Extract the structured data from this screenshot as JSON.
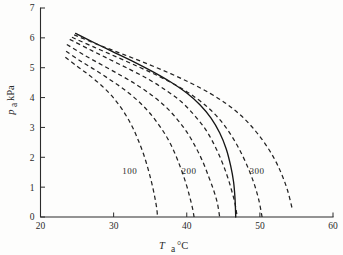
{
  "chart_data": {
    "type": "line",
    "title": "",
    "xlabel": "T, °C",
    "ylabel": "p, kPa",
    "xlabel_symbol": "T",
    "xlabel_subscript": "a",
    "xlabel_unit": "°C",
    "ylabel_symbol": "p",
    "ylabel_subscript": "a",
    "ylabel_unit": "kPa",
    "xlim": [
      20,
      60
    ],
    "ylim": [
      0,
      7
    ],
    "xticks": [
      20,
      30,
      40,
      50,
      60
    ],
    "xtick_labels": [
      "20",
      "30",
      "40",
      "50",
      "60"
    ],
    "yticks": [
      0,
      1,
      2,
      3,
      4,
      5,
      6,
      7
    ],
    "ytick_labels": [
      "0",
      "1",
      "2",
      "3",
      "4",
      "5",
      "6",
      "7"
    ],
    "grid": false,
    "legend": "none",
    "annotations": [
      {
        "text": "100",
        "x": 32.2,
        "y": 1.45
      },
      {
        "text": "200",
        "x": 40.3,
        "y": 1.45
      },
      {
        "text": "300",
        "x": 49.6,
        "y": 1.45
      }
    ],
    "series": [
      {
        "name": "curve-1",
        "style": "dashed",
        "label": "100",
        "points": [
          [
            23.4,
            5.35
          ],
          [
            25.0,
            5.05
          ],
          [
            26.5,
            4.78
          ],
          [
            28.0,
            4.48
          ],
          [
            29.4,
            4.15
          ],
          [
            30.6,
            3.8
          ],
          [
            31.7,
            3.4
          ],
          [
            32.6,
            3.0
          ],
          [
            33.4,
            2.55
          ],
          [
            34.1,
            2.1
          ],
          [
            34.7,
            1.62
          ],
          [
            35.2,
            1.15
          ],
          [
            35.6,
            0.7
          ],
          [
            35.9,
            0.28
          ],
          [
            36.0,
            0.0
          ]
        ]
      },
      {
        "name": "curve-2",
        "style": "dashed",
        "points": [
          [
            23.5,
            5.55
          ],
          [
            25.5,
            5.22
          ],
          [
            27.5,
            4.92
          ],
          [
            29.5,
            4.6
          ],
          [
            31.4,
            4.28
          ],
          [
            33.2,
            3.92
          ],
          [
            34.8,
            3.52
          ],
          [
            36.2,
            3.08
          ],
          [
            37.4,
            2.62
          ],
          [
            38.4,
            2.12
          ],
          [
            39.2,
            1.62
          ],
          [
            39.9,
            1.12
          ],
          [
            40.4,
            0.68
          ],
          [
            40.8,
            0.28
          ],
          [
            41.0,
            0.0
          ]
        ]
      },
      {
        "name": "curve-3",
        "style": "dashed",
        "points": [
          [
            23.6,
            5.78
          ],
          [
            26.0,
            5.42
          ],
          [
            28.5,
            5.08
          ],
          [
            31.0,
            4.74
          ],
          [
            33.2,
            4.42
          ],
          [
            35.2,
            4.08
          ],
          [
            37.0,
            3.72
          ],
          [
            38.6,
            3.3
          ],
          [
            40.0,
            2.85
          ],
          [
            41.2,
            2.35
          ],
          [
            42.2,
            1.85
          ],
          [
            43.0,
            1.35
          ],
          [
            43.7,
            0.88
          ],
          [
            44.2,
            0.45
          ],
          [
            44.5,
            0.0
          ]
        ]
      },
      {
        "name": "curve-4",
        "style": "dashed",
        "label": "200",
        "points": [
          [
            24.0,
            5.95
          ],
          [
            26.8,
            5.6
          ],
          [
            29.6,
            5.26
          ],
          [
            32.4,
            4.92
          ],
          [
            35.0,
            4.58
          ],
          [
            37.3,
            4.22
          ],
          [
            39.3,
            3.85
          ],
          [
            41.0,
            3.42
          ],
          [
            42.5,
            2.96
          ],
          [
            43.7,
            2.45
          ],
          [
            44.7,
            1.92
          ],
          [
            45.5,
            1.4
          ],
          [
            46.1,
            0.92
          ],
          [
            46.6,
            0.45
          ],
          [
            46.9,
            0.0
          ]
        ]
      },
      {
        "name": "curve-solid",
        "style": "solid",
        "points": [
          [
            24.8,
            6.15
          ],
          [
            27.5,
            5.82
          ],
          [
            30.2,
            5.5
          ],
          [
            32.9,
            5.18
          ],
          [
            35.4,
            4.86
          ],
          [
            37.8,
            4.52
          ],
          [
            40.0,
            4.15
          ],
          [
            41.8,
            3.76
          ],
          [
            43.3,
            3.32
          ],
          [
            44.5,
            2.82
          ],
          [
            45.4,
            2.28
          ],
          [
            46.0,
            1.72
          ],
          [
            46.4,
            1.18
          ],
          [
            46.6,
            0.62
          ],
          [
            46.7,
            0.0
          ]
        ]
      },
      {
        "name": "curve-5",
        "style": "dashed",
        "points": [
          [
            24.3,
            6.02
          ],
          [
            27.4,
            5.68
          ],
          [
            30.5,
            5.35
          ],
          [
            33.5,
            5.02
          ],
          [
            36.3,
            4.7
          ],
          [
            38.9,
            4.36
          ],
          [
            41.2,
            4.0
          ],
          [
            43.2,
            3.6
          ],
          [
            44.9,
            3.15
          ],
          [
            46.3,
            2.65
          ],
          [
            47.5,
            2.12
          ],
          [
            48.5,
            1.58
          ],
          [
            49.3,
            1.05
          ],
          [
            49.9,
            0.52
          ],
          [
            50.3,
            0.0
          ]
        ]
      },
      {
        "name": "curve-6",
        "style": "dashed",
        "label": "300",
        "points": [
          [
            24.6,
            6.1
          ],
          [
            28.0,
            5.76
          ],
          [
            31.4,
            5.44
          ],
          [
            34.7,
            5.12
          ],
          [
            37.8,
            4.8
          ],
          [
            40.6,
            4.48
          ],
          [
            43.2,
            4.14
          ],
          [
            45.5,
            3.78
          ],
          [
            47.5,
            3.38
          ],
          [
            49.2,
            2.94
          ],
          [
            50.7,
            2.46
          ],
          [
            52.0,
            1.94
          ],
          [
            53.0,
            1.42
          ],
          [
            53.8,
            0.88
          ],
          [
            54.4,
            0.3
          ]
        ]
      }
    ]
  }
}
